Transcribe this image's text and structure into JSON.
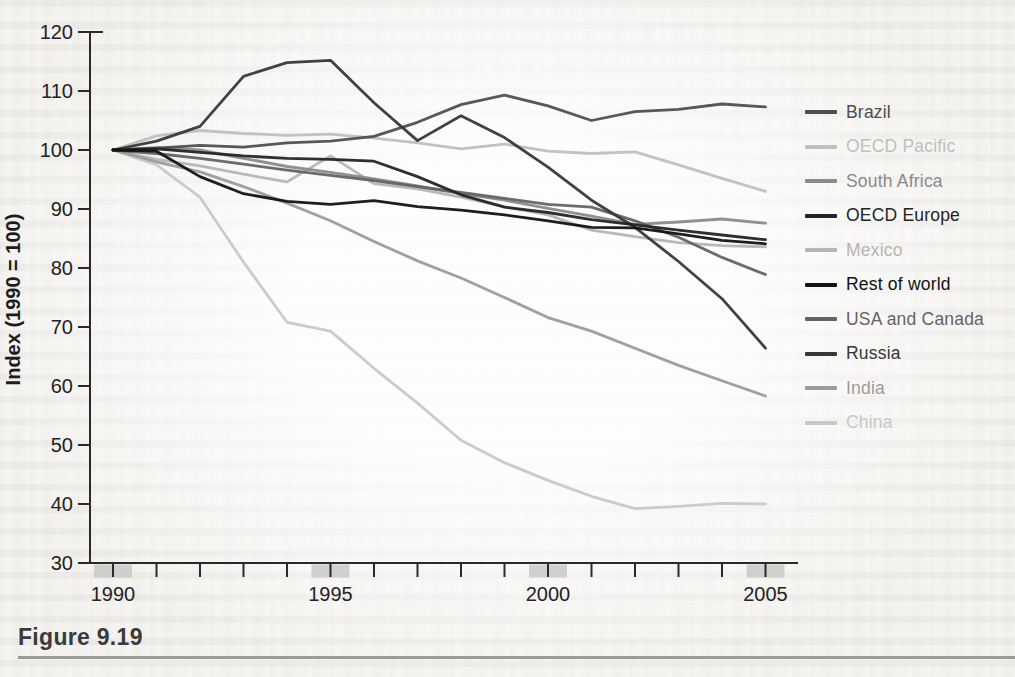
{
  "figure": {
    "caption": "Figure 9.19"
  },
  "chart_data": {
    "type": "line",
    "title": "",
    "xlabel": "",
    "ylabel": "Index (1990 = 100)",
    "x": [
      1990,
      1991,
      1992,
      1993,
      1994,
      1995,
      1996,
      1997,
      1998,
      1999,
      2000,
      2001,
      2002,
      2003,
      2004,
      2005
    ],
    "x_ticks_labeled": [
      1990,
      1995,
      2000,
      2005
    ],
    "x_tick_labels": [
      "1990",
      "1995",
      "2000",
      "2005"
    ],
    "ylim": [
      30,
      120
    ],
    "y_ticks": [
      30,
      40,
      50,
      60,
      70,
      80,
      90,
      100,
      110,
      120
    ],
    "grid": "off",
    "legend_position": "right",
    "axis_color": "#2a2a2a",
    "series": [
      {
        "name": "Brazil",
        "color": "#4f4f4d",
        "values": [
          100,
          100.3,
          100.8,
          100.5,
          101.2,
          101.5,
          102.3,
          104.7,
          107.7,
          109.3,
          107.5,
          105.0,
          106.5,
          106.9,
          107.8,
          107.3
        ]
      },
      {
        "name": "OECD Pacific",
        "color": "#bfbfbd",
        "values": [
          100,
          102.4,
          103.3,
          102.8,
          102.5,
          102.7,
          102.0,
          101.2,
          100.2,
          101.0,
          99.8,
          99.4,
          99.7,
          97.5,
          95.2,
          93.0
        ]
      },
      {
        "name": "South Africa",
        "color": "#8a8a88",
        "values": [
          100,
          100.4,
          100.0,
          98.6,
          97.2,
          96.2,
          95.1,
          93.9,
          92.6,
          91.5,
          90.1,
          88.8,
          87.4,
          87.8,
          88.3,
          87.6
        ]
      },
      {
        "name": "OECD Europe",
        "color": "#242422",
        "values": [
          100,
          100.2,
          99.6,
          99.0,
          98.6,
          98.4,
          98.1,
          95.5,
          92.4,
          90.3,
          89.4,
          88.2,
          87.3,
          86.4,
          85.6,
          84.8
        ]
      },
      {
        "name": "Mexico",
        "color": "#b5b5b3",
        "values": [
          100,
          98.4,
          97.3,
          95.9,
          94.6,
          99.0,
          94.3,
          93.4,
          92.0,
          90.4,
          89.0,
          86.4,
          85.3,
          84.3,
          83.8,
          83.6
        ]
      },
      {
        "name": "Rest of world",
        "color": "#121212",
        "values": [
          100,
          99.8,
          95.5,
          92.6,
          91.3,
          90.8,
          91.4,
          90.4,
          89.8,
          89.0,
          88.0,
          86.9,
          86.8,
          85.8,
          84.7,
          84.1
        ]
      },
      {
        "name": "USA and Canada",
        "color": "#636361",
        "values": [
          100,
          99.4,
          98.6,
          97.6,
          96.6,
          95.7,
          94.8,
          93.8,
          92.8,
          91.8,
          90.8,
          90.3,
          88.0,
          85.2,
          81.8,
          78.9
        ]
      },
      {
        "name": "Russia",
        "color": "#373735",
        "values": [
          100,
          101.5,
          104.0,
          112.5,
          114.8,
          115.2,
          108.0,
          101.6,
          105.8,
          102.1,
          97.1,
          91.5,
          86.9,
          81.1,
          74.8,
          66.4
        ]
      },
      {
        "name": "India",
        "color": "#9b9b99",
        "values": [
          100,
          98.0,
          96.3,
          93.8,
          91.0,
          88.0,
          84.5,
          81.2,
          78.3,
          75.0,
          71.6,
          69.3,
          66.4,
          63.5,
          60.9,
          58.3
        ]
      },
      {
        "name": "China",
        "color": "#c8c8c6",
        "values": [
          100,
          97.5,
          92.0,
          81.0,
          70.8,
          69.3,
          63.0,
          57.1,
          50.8,
          47.0,
          44.0,
          41.3,
          39.2,
          39.6,
          40.1,
          40.0
        ]
      }
    ]
  }
}
